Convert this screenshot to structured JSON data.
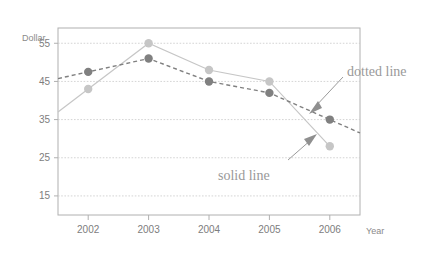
{
  "chart_data": {
    "type": "line",
    "title": "",
    "xlabel": "Year",
    "ylabel": "Dollar",
    "categories": [
      "2002",
      "2003",
      "2004",
      "2005",
      "2006"
    ],
    "x": [
      2002,
      2003,
      2004,
      2005,
      2006
    ],
    "xlim": [
      2001.5,
      2006.5
    ],
    "ylim": [
      10,
      59
    ],
    "yticks": [
      15,
      25,
      35,
      45,
      55
    ],
    "ytick_labels": [
      "15",
      "25",
      "35",
      "45",
      "55"
    ],
    "xtick_labels": [
      "2002",
      "2003",
      "2004",
      "2005",
      "2006"
    ],
    "grid": true,
    "legend": "none",
    "series": [
      {
        "name": "dotted line",
        "style": "dashed",
        "color": "#808080",
        "marker": "circle",
        "values": [
          47.5,
          51,
          45,
          42,
          35
        ]
      },
      {
        "name": "solid line",
        "style": "solid",
        "color": "#c6c6c6",
        "marker": "circle",
        "values": [
          43,
          55,
          48,
          45,
          28
        ]
      }
    ],
    "annotations": [
      {
        "text": "dotted line",
        "target_series": "dotted line",
        "x": 2005.6,
        "y": 38
      },
      {
        "text": "solid line",
        "target_series": "solid line",
        "x": 2005.55,
        "y": 34
      }
    ]
  },
  "labels": {
    "y_axis_title": "Dollar",
    "x_axis_title": "Year",
    "annotation_dotted": "dotted line",
    "annotation_solid": "solid line"
  },
  "colors": {
    "dotted_series": "#808080",
    "solid_series": "#c6c6c6",
    "grid": "#c9c9c9",
    "frame": "#b0b0b0",
    "text": "#8a8a8a",
    "background": "#ffffff"
  },
  "ticks": {
    "y": [
      "55",
      "45",
      "35",
      "25",
      "15"
    ],
    "x": [
      "2002",
      "2003",
      "2004",
      "2005",
      "2006"
    ]
  }
}
